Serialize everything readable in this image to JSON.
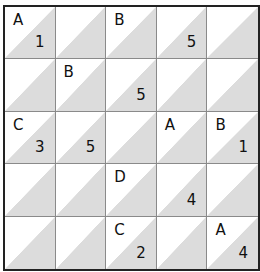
{
  "puzzle": {
    "rows": 5,
    "cols": 5,
    "colors": {
      "upper_triangle": "#ffffff",
      "lower_triangle": "#dcdcdc",
      "grid_line": "#8a8a8a",
      "border": "#222222",
      "text": "#111111"
    },
    "cells": [
      [
        {
          "letter": "A",
          "number": "1"
        },
        {
          "letter": "",
          "number": ""
        },
        {
          "letter": "B",
          "number": ""
        },
        {
          "letter": "",
          "number": "5"
        },
        {
          "letter": "",
          "number": ""
        }
      ],
      [
        {
          "letter": "",
          "number": ""
        },
        {
          "letter": "B",
          "number": ""
        },
        {
          "letter": "",
          "number": "5"
        },
        {
          "letter": "",
          "number": ""
        },
        {
          "letter": "",
          "number": ""
        }
      ],
      [
        {
          "letter": "C",
          "number": "3"
        },
        {
          "letter": "",
          "number": "5"
        },
        {
          "letter": "",
          "number": ""
        },
        {
          "letter": "A",
          "number": ""
        },
        {
          "letter": "B",
          "number": "1"
        }
      ],
      [
        {
          "letter": "",
          "number": ""
        },
        {
          "letter": "",
          "number": ""
        },
        {
          "letter": "D",
          "number": ""
        },
        {
          "letter": "",
          "number": "4"
        },
        {
          "letter": "",
          "number": ""
        }
      ],
      [
        {
          "letter": "",
          "number": ""
        },
        {
          "letter": "",
          "number": ""
        },
        {
          "letter": "C",
          "number": "2"
        },
        {
          "letter": "",
          "number": ""
        },
        {
          "letter": "A",
          "number": "4"
        }
      ]
    ]
  }
}
